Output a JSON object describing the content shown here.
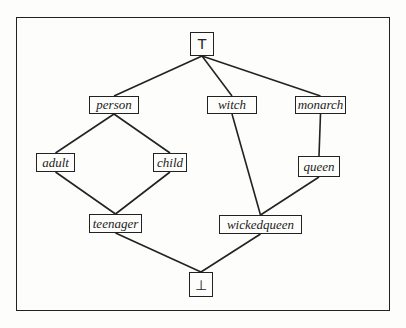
{
  "diagram": {
    "type": "lattice",
    "nodes": [
      {
        "id": "top",
        "label": "T",
        "x": 190,
        "y": 32,
        "w": 24,
        "h": 24,
        "symbol": true
      },
      {
        "id": "person",
        "label": "person",
        "x": 89,
        "y": 96,
        "w": 50,
        "h": 18
      },
      {
        "id": "witch",
        "label": "witch",
        "x": 207,
        "y": 96,
        "w": 50,
        "h": 18
      },
      {
        "id": "monarch",
        "label": "monarch",
        "x": 295,
        "y": 96,
        "w": 51,
        "h": 18
      },
      {
        "id": "adult",
        "label": "adult",
        "x": 36,
        "y": 153,
        "w": 39,
        "h": 19
      },
      {
        "id": "child",
        "label": "child",
        "x": 153,
        "y": 153,
        "w": 34,
        "h": 19
      },
      {
        "id": "queen",
        "label": "queen",
        "x": 298,
        "y": 156,
        "w": 42,
        "h": 21
      },
      {
        "id": "teenager",
        "label": "teenager",
        "x": 89,
        "y": 214,
        "w": 53,
        "h": 19
      },
      {
        "id": "wickedqueen",
        "label": "wickedqueen",
        "x": 219,
        "y": 215,
        "w": 83,
        "h": 19
      },
      {
        "id": "bottom",
        "label": "⊥",
        "x": 189,
        "y": 272,
        "w": 24,
        "h": 25,
        "symbol": true
      }
    ],
    "edges": [
      [
        "top",
        "person"
      ],
      [
        "top",
        "witch"
      ],
      [
        "top",
        "monarch"
      ],
      [
        "person",
        "adult"
      ],
      [
        "person",
        "child"
      ],
      [
        "monarch",
        "queen"
      ],
      [
        "adult",
        "teenager"
      ],
      [
        "child",
        "teenager"
      ],
      [
        "witch",
        "wickedqueen"
      ],
      [
        "queen",
        "wickedqueen"
      ],
      [
        "teenager",
        "bottom"
      ],
      [
        "wickedqueen",
        "bottom"
      ]
    ]
  }
}
